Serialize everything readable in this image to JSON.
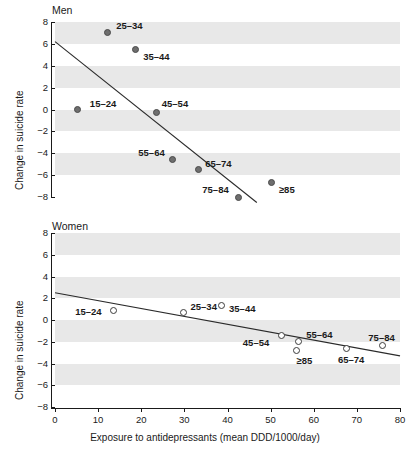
{
  "figure": {
    "xlabel": "Exposure to antidepressants (mean DDD/1000/day)",
    "ylabel": "Change in suicide rate",
    "xticks": [
      "0",
      "10",
      "20",
      "30",
      "40",
      "50",
      "60",
      "70",
      "80"
    ],
    "yticks": [
      "8",
      "6",
      "4",
      "2",
      "0",
      "−2",
      "−4",
      "−6",
      "−8"
    ],
    "panels": [
      {
        "title": "Men"
      },
      {
        "title": "Women"
      }
    ],
    "colors": {
      "band": "#e8e8e8",
      "axis": "#1a1a1a",
      "marker_fill_men": "#6e6e6e",
      "marker_edge_men": "#4a4a4a",
      "marker_fill_women": "#ffffff",
      "marker_edge_women": "#3c3c3c",
      "fitline": "#2a2a2a"
    }
  },
  "chart_data": [
    {
      "type": "scatter",
      "title": "Men",
      "xlabel": "Exposure to antidepressants (mean DDD/1000/day)",
      "ylabel": "Change in suicide rate",
      "xlim": [
        0,
        80
      ],
      "ylim": [
        -8,
        8
      ],
      "xticks": [
        0,
        10,
        20,
        30,
        40,
        50,
        60,
        70,
        80
      ],
      "yticks": [
        -8,
        -6,
        -4,
        -2,
        0,
        2,
        4,
        6,
        8
      ],
      "grid": "horizontal-bands",
      "legend": "none",
      "marker_style": "filled-circle",
      "points": [
        {
          "label": "15–24",
          "x": 5.3,
          "y": 0.0,
          "lx": 12,
          "ly": -11
        },
        {
          "label": "25–34",
          "x": 12.1,
          "y": 7.0,
          "lx": 9,
          "ly": -12
        },
        {
          "label": "35–44",
          "x": 18.6,
          "y": 5.5,
          "lx": 8,
          "ly": 3
        },
        {
          "label": "45–54",
          "x": 23.6,
          "y": -0.3,
          "lx": 5,
          "ly": -14
        },
        {
          "label": "55–64",
          "x": 27.2,
          "y": -4.6,
          "lx": -34,
          "ly": -12
        },
        {
          "label": "65–74",
          "x": 33.2,
          "y": -5.5,
          "lx": 7,
          "ly": -11
        },
        {
          "label": "75–84",
          "x": 42.5,
          "y": -8.0,
          "lx": -36,
          "ly": -12
        },
        {
          "label": "≥85",
          "x": 50.3,
          "y": -6.7,
          "lx": 7,
          "ly": 2
        }
      ],
      "fitline": {
        "x0": 0.0,
        "y0": 6.2,
        "x1": 46.8,
        "y1": -8.5
      }
    },
    {
      "type": "scatter",
      "title": "Women",
      "xlabel": "Exposure to antidepressants (mean DDD/1000/day)",
      "ylabel": "Change in suicide rate",
      "xlim": [
        0,
        80
      ],
      "ylim": [
        -8,
        8
      ],
      "xticks": [
        0,
        10,
        20,
        30,
        40,
        50,
        60,
        70,
        80
      ],
      "yticks": [
        -8,
        -6,
        -4,
        -2,
        0,
        2,
        4,
        6,
        8
      ],
      "grid": "horizontal-bands",
      "legend": "none",
      "marker_style": "open-circle",
      "points": [
        {
          "label": "15–24",
          "x": 13.5,
          "y": 0.9,
          "lx": -38,
          "ly": -3
        },
        {
          "label": "25–34",
          "x": 29.8,
          "y": 0.7,
          "lx": 7,
          "ly": -10
        },
        {
          "label": "35–44",
          "x": 38.5,
          "y": 1.3,
          "lx": 8,
          "ly": -2
        },
        {
          "label": "45–54",
          "x": 52.6,
          "y": -1.4,
          "lx": -39,
          "ly": 3
        },
        {
          "label": "55–64",
          "x": 56.4,
          "y": -2.0,
          "lx": 8,
          "ly": -12
        },
        {
          "label": "≥85",
          "x": 56.0,
          "y": -2.8,
          "lx": 0,
          "ly": 6
        },
        {
          "label": "65–74",
          "x": 67.7,
          "y": -2.6,
          "lx": -9,
          "ly": 7
        },
        {
          "label": "75–84",
          "x": 75.9,
          "y": -2.3,
          "lx": -14,
          "ly": -12
        }
      ],
      "fitline": {
        "x0": 0.0,
        "y0": 2.5,
        "x1": 80.0,
        "y1": -3.3
      }
    }
  ]
}
